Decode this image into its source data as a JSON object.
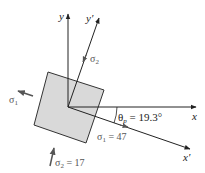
{
  "diagram": {
    "axes": {
      "x": "x",
      "y": "y",
      "x_prime": "x′",
      "y_prime": "y′"
    },
    "stresses": {
      "sigma1_left": "σ",
      "sigma1_left_sub": "1",
      "sigma2_top": "σ",
      "sigma2_top_sub": "2",
      "sigma1_value_label": "σ",
      "sigma1_value_sub": "1",
      "sigma1_value": " = 47",
      "sigma2_value_label": "σ",
      "sigma2_value_sub": "2",
      "sigma2_value": " = 17"
    },
    "angle": {
      "symbol": "θ",
      "sub": "p",
      "value": " = 19.3°"
    },
    "colors": {
      "element_fill": "#d9d9d9",
      "element_stroke": "#333333",
      "axis": "#222222",
      "stress_label": "#555555",
      "stress_arrow": "#555555"
    }
  }
}
